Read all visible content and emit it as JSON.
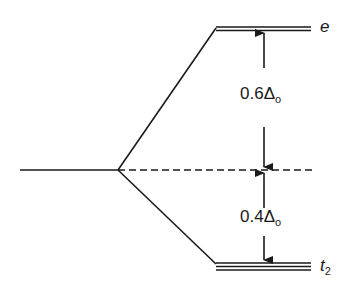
{
  "diagram": {
    "type": "crystal-field-splitting-octahedral",
    "levels": {
      "upper": {
        "label": "e",
        "lines": 2
      },
      "lower": {
        "label_main": "t",
        "label_sub": "2",
        "lines": 3
      }
    },
    "gaps": {
      "upper": {
        "coef": "0.6",
        "symbol": "Δ",
        "sub": "o"
      },
      "lower": {
        "coef": "0.4",
        "symbol": "Δ",
        "sub": "o"
      }
    },
    "colors": {
      "line": "#1a1a1a",
      "background": "#ffffff"
    }
  }
}
